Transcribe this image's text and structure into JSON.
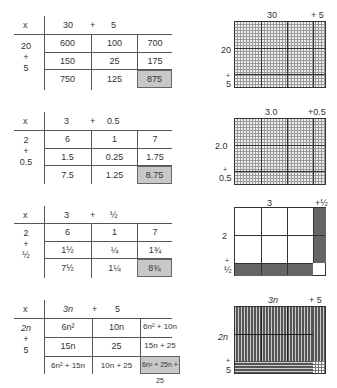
{
  "tables": [
    {
      "op": "x",
      "col_a": "30",
      "plus": "+",
      "col_b": "5",
      "row_a": "20",
      "row_plus": "+",
      "row_b": "5",
      "r1": [
        "600",
        "100",
        "700"
      ],
      "r2": [
        "150",
        "25",
        "175"
      ],
      "r3": [
        "750",
        "125",
        "875"
      ]
    },
    {
      "op": "x",
      "col_a": "3",
      "plus": "+",
      "col_b": "0.5",
      "row_a": "2",
      "row_plus": "+",
      "row_b": "0.5",
      "r1": [
        "6",
        "1",
        "7"
      ],
      "r2": [
        "1.5",
        "0.25",
        "1.75"
      ],
      "r3": [
        "7.5",
        "1.25",
        "8.75"
      ]
    },
    {
      "op": "x",
      "col_a": "3",
      "plus": "+",
      "col_b": "½",
      "row_a": "2",
      "row_plus": "+",
      "row_b": "½",
      "r1": [
        "6",
        "1",
        "7"
      ],
      "r2": [
        "1½",
        "¼",
        "1¾"
      ],
      "r3": [
        "7½",
        "1¼",
        "8¾"
      ]
    },
    {
      "op": "x",
      "col_a": "3n",
      "plus": "+",
      "col_b": "5",
      "row_a": "2n",
      "row_plus": "+",
      "row_b": "5",
      "r1": [
        "6n²",
        "10n",
        "6n² + 10n"
      ],
      "r2": [
        "15n",
        "25",
        "15n + 25"
      ],
      "r3": [
        "6n² + 15n",
        "10n + 25",
        "6n² + 25n + 25"
      ]
    }
  ],
  "grids": [
    {
      "top_a": "30",
      "top_b": "+ 5",
      "side_a": "20",
      "side_plus": "+",
      "side_b": "5"
    },
    {
      "top_a": "3.0",
      "top_b": "+0.5",
      "side_a": "2.0",
      "side_plus": "+",
      "side_b": "0.5"
    },
    {
      "top_a": "3",
      "top_b": "+½",
      "side_a": "2",
      "side_plus": "+",
      "side_b": "½"
    },
    {
      "top_a": "3n",
      "top_b": "+ 5",
      "side_a": "2n",
      "side_plus": "+",
      "side_b": "5"
    }
  ],
  "colors": {
    "total_fill": "#c8c8c8",
    "dark_fill": "#555555",
    "line": "#555555"
  }
}
